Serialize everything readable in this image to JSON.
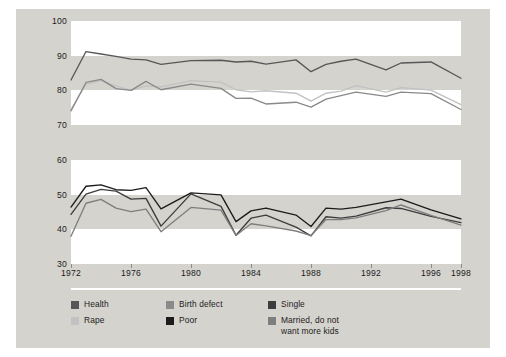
{
  "chart_data": {
    "type": "line",
    "title": "",
    "xlabel": "",
    "ylabel": "Percentage Giving a Pro-Choice Response",
    "xlim": [
      1972,
      1998
    ],
    "ylim": [
      30,
      100
    ],
    "yticks": [
      30,
      40,
      50,
      60,
      70,
      80,
      90,
      100
    ],
    "xticks": [
      1972,
      1976,
      1980,
      1984,
      1988,
      1992,
      1996,
      1998
    ],
    "x": [
      1972,
      1973,
      1974,
      1975,
      1976,
      1977,
      1978,
      1980,
      1982,
      1983,
      1984,
      1985,
      1987,
      1988,
      1989,
      1990,
      1991,
      1993,
      1994,
      1996,
      1998
    ],
    "grid": "alternating-horizontal-bands",
    "legend_position": "below",
    "series": [
      {
        "name": "Health",
        "color": "#575757",
        "values": [
          83.0,
          91.2,
          90.5,
          89.8,
          89.0,
          88.8,
          87.5,
          88.6,
          88.7,
          88.2,
          88.4,
          87.6,
          88.8,
          85.4,
          87.5,
          88.4,
          89.0,
          85.9,
          87.9,
          88.2,
          83.5
        ]
      },
      {
        "name": "Rape",
        "color": "#c2c2c2",
        "values": [
          74.5,
          81.8,
          82.8,
          81.3,
          80.0,
          81.3,
          81.0,
          82.8,
          82.4,
          80.2,
          79.6,
          79.9,
          79.2,
          76.9,
          79.2,
          79.8,
          81.4,
          79.5,
          80.8,
          80.1,
          75.9
        ]
      },
      {
        "name": "Birth defect",
        "color": "#8a8a8a",
        "values": [
          74.1,
          82.3,
          83.2,
          80.5,
          80.0,
          82.6,
          80.2,
          81.8,
          80.6,
          77.7,
          77.8,
          76.1,
          76.6,
          75.2,
          77.5,
          78.5,
          79.5,
          78.3,
          79.5,
          79.1,
          74.5
        ]
      },
      {
        "name": "Single",
        "color": "#3d3d3d",
        "values": [
          44.3,
          50.1,
          51.5,
          51.0,
          48.7,
          48.9,
          40.9,
          50.2,
          46.6,
          38.3,
          43.2,
          44.1,
          40.6,
          38.1,
          43.6,
          43.2,
          43.8,
          46.2,
          46.0,
          43.7,
          41.9
        ]
      },
      {
        "name": "Poor",
        "color": "#1c1c1c",
        "values": [
          46.4,
          52.4,
          52.8,
          51.4,
          51.2,
          52.0,
          45.9,
          50.5,
          49.9,
          42.2,
          45.3,
          46.1,
          44.1,
          40.8,
          46.1,
          45.8,
          46.3,
          47.9,
          48.7,
          45.6,
          43.0
        ]
      },
      {
        "name": "Married, do not\nwant more kids",
        "color": "#7e7e7e",
        "values": [
          38.0,
          47.5,
          48.6,
          46.1,
          45.1,
          45.8,
          39.3,
          46.3,
          45.5,
          38.2,
          41.6,
          41.0,
          39.5,
          38.2,
          42.8,
          42.8,
          43.3,
          45.4,
          47.0,
          44.0,
          41.2
        ]
      }
    ]
  },
  "axis": {
    "ytitle": "Percentage Giving a Pro-Choice Response"
  },
  "legend": {
    "columns": [
      {
        "items": [
          {
            "label": "Health",
            "color": "#575757"
          },
          {
            "label": "Rape",
            "color": "#c2c2c2"
          }
        ]
      },
      {
        "items": [
          {
            "label": "Birth defect",
            "color": "#8a8a8a"
          },
          {
            "label": "Poor",
            "color": "#1c1c1c"
          }
        ]
      },
      {
        "items": [
          {
            "label": "Single",
            "color": "#3d3d3d"
          },
          {
            "label": "Married, do not\nwant more kids",
            "color": "#7e7e7e"
          }
        ]
      }
    ]
  },
  "style": {
    "panel_background": "#d5d3ce",
    "band_color": "#ffffff",
    "text_color": "#1b1b1b"
  }
}
